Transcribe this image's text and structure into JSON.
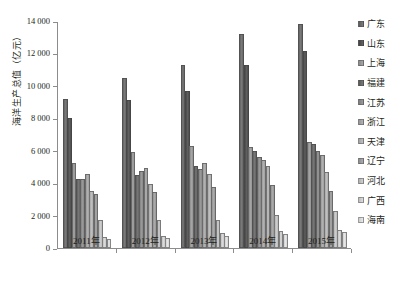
{
  "chart_data": {
    "type": "bar",
    "title": "",
    "xlabel": "",
    "ylabel": "海洋生产总值（亿元）",
    "ylim": [
      0,
      14000
    ],
    "ytick_step": 2000,
    "ytick_labels": [
      "14 000",
      "12 000",
      "10 000",
      "8 000",
      "6 000",
      "4 000",
      "2 000",
      "0"
    ],
    "ytick_values": [
      14000,
      12000,
      10000,
      8000,
      6000,
      4000,
      2000,
      0
    ],
    "grid": false,
    "legend_position": "right",
    "categories": [
      "2011年",
      "2012年",
      "2013年",
      "2014年",
      "2015年"
    ],
    "series": [
      {
        "name": "广东",
        "color": "#6e6e6e",
        "values": [
          9191,
          10506,
          11283,
          13229,
          13796
        ]
      },
      {
        "name": "山东",
        "color": "#555555",
        "values": [
          8029,
          9111,
          9696,
          11288,
          12170
        ]
      },
      {
        "name": "上海",
        "color": "#9a9a9a",
        "values": [
          5224,
          5946,
          6305,
          6249,
          6513
        ]
      },
      {
        "name": "福建",
        "color": "#6b6b6b",
        "values": [
          4284,
          4483,
          5028,
          5980,
          6403
        ]
      },
      {
        "name": "江苏",
        "color": "#8e8e8e",
        "values": [
          4253,
          4723,
          4852,
          5590,
          6002
        ]
      },
      {
        "name": "浙江",
        "color": "#a6a6a6",
        "values": [
          4536,
          4947,
          5258,
          5438,
          5730
        ]
      },
      {
        "name": "天津",
        "color": "#b4b4b4",
        "values": [
          3536,
          3939,
          4554,
          5032,
          4700
        ]
      },
      {
        "name": "辽宁",
        "color": "#9f9f9f",
        "values": [
          3345,
          3459,
          3741,
          3917,
          3529
        ]
      },
      {
        "name": "河北",
        "color": "#c2c2c2",
        "values": [
          1700,
          1750,
          1741,
          2051,
          2271
        ]
      },
      {
        "name": "广西",
        "color": "#cfcfcf",
        "values": [
          700,
          750,
          899,
          1021,
          1095
        ]
      },
      {
        "name": "海南",
        "color": "#dcdcdc",
        "values": [
          578,
          620,
          770,
          895,
          1000
        ]
      }
    ]
  },
  "legend": {
    "items": [
      "广东",
      "山东",
      "上海",
      "福建",
      "江苏",
      "浙江",
      "天津",
      "辽宁",
      "河北",
      "广西",
      "海南"
    ]
  },
  "axes": {
    "y_title": "海洋生产总值（亿元）"
  }
}
